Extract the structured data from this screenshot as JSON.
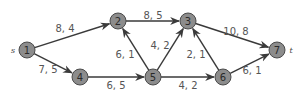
{
  "diagram": {
    "type": "flow-network",
    "source_label": "s",
    "sink_label": "t",
    "nodes": [
      {
        "id": "1",
        "label": "1",
        "x": 27,
        "y": 50
      },
      {
        "id": "2",
        "label": "2",
        "x": 118,
        "y": 21
      },
      {
        "id": "3",
        "label": "3",
        "x": 188,
        "y": 21
      },
      {
        "id": "4",
        "label": "4",
        "x": 80,
        "y": 77
      },
      {
        "id": "5",
        "label": "5",
        "x": 153,
        "y": 77
      },
      {
        "id": "6",
        "label": "6",
        "x": 223,
        "y": 77
      },
      {
        "id": "7",
        "label": "7",
        "x": 277,
        "y": 50
      }
    ],
    "edges": [
      {
        "from": "1",
        "to": "2",
        "label": "8, 4",
        "lx": 65,
        "ly": 28
      },
      {
        "from": "1",
        "to": "4",
        "label": "7, 5",
        "lx": 48,
        "ly": 69
      },
      {
        "from": "2",
        "to": "3",
        "label": "8, 5",
        "lx": 153,
        "ly": 15
      },
      {
        "from": "5",
        "to": "2",
        "label": "6, 1",
        "lx": 125,
        "ly": 54
      },
      {
        "from": "5",
        "to": "3",
        "label": "4, 2",
        "lx": 160,
        "ly": 45
      },
      {
        "from": "4",
        "to": "5",
        "label": "6, 5",
        "lx": 116,
        "ly": 85
      },
      {
        "from": "5",
        "to": "6",
        "label": "4, 2",
        "lx": 188,
        "ly": 85
      },
      {
        "from": "6",
        "to": "3",
        "label": "2, 1",
        "lx": 196,
        "ly": 54
      },
      {
        "from": "3",
        "to": "7",
        "label": "10, 8",
        "lx": 236,
        "ly": 31
      },
      {
        "from": "6",
        "to": "7",
        "label": "6, 1",
        "lx": 252,
        "ly": 70
      }
    ]
  }
}
